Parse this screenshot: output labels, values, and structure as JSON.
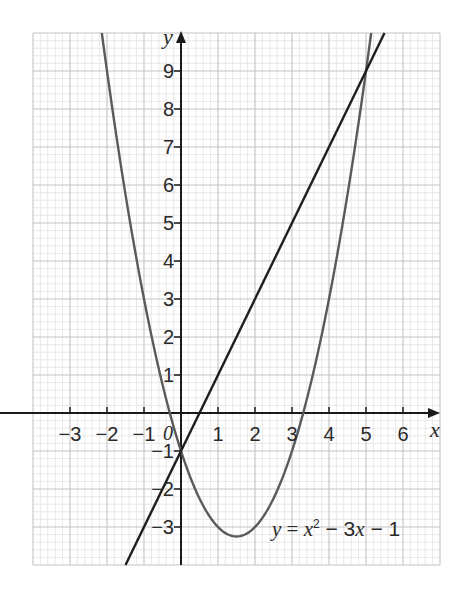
{
  "chart_data": {
    "type": "line",
    "title": "",
    "xlabel": "x",
    "ylabel": "y",
    "xlim": [
      -4,
      7
    ],
    "ylim": [
      -4,
      10
    ],
    "grid": true,
    "grid_minor_subdivisions": 5,
    "x_ticks": [
      -3,
      -2,
      -1,
      0,
      1,
      2,
      3,
      4,
      5,
      6
    ],
    "x_tick_labels": [
      "−3",
      "−2",
      "−1",
      "0",
      "1",
      "2",
      "3",
      "4",
      "5",
      "6"
    ],
    "y_ticks": [
      -3,
      -2,
      -1,
      1,
      2,
      3,
      4,
      5,
      6,
      7,
      8,
      9
    ],
    "y_tick_labels": [
      "−3",
      "−2",
      "−1",
      "1",
      "2",
      "3",
      "4",
      "5",
      "6",
      "7",
      "8",
      "9"
    ],
    "series": [
      {
        "name": "y = x² − 3x − 1",
        "kind": "parabola",
        "equation": "y = x^2 - 3x - 1",
        "coefficients": {
          "a": 1,
          "b": -3,
          "c": -1
        },
        "x_range": [
          -2.14,
          5.14
        ],
        "vertex": [
          1.5,
          -3.25
        ],
        "color": "#5a5a5a"
      },
      {
        "name": "y = 2x − 1",
        "kind": "line",
        "equation": "y = 2x - 1",
        "coefficients": {
          "m": 2,
          "c": -1
        },
        "x_range": [
          -1.5,
          5.5
        ],
        "color": "#1e1e1e"
      }
    ],
    "intersections": [
      [
        0,
        -1
      ],
      [
        5,
        9
      ]
    ],
    "annotations": [
      {
        "text": "y = x² − 3x − 1",
        "x": 1.25,
        "y": -3.2
      }
    ]
  },
  "labels": {
    "x_axis": "x",
    "y_axis": "y",
    "origin": "0",
    "equation": {
      "y": "y",
      "eq": " = ",
      "x": "x",
      "sup": "2",
      "rest1": " − 3",
      "x2": "x",
      "rest2": " − 1"
    }
  },
  "colors": {
    "background": "#ffffff",
    "grid_major": "#c4c4c4",
    "grid_minor": "#e2e2e2",
    "axis": "#1a1a1a",
    "text": "#2a2a2a"
  }
}
